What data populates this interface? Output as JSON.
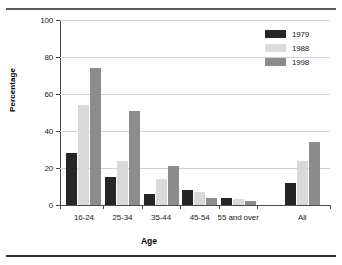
{
  "chart_data": {
    "type": "bar",
    "title": "",
    "xlabel": "Age",
    "ylabel": "Percentage",
    "categories": [
      "16-24",
      "25-34",
      "35-44",
      "45-54",
      "55 and over",
      "All"
    ],
    "series": [
      {
        "name": "1979",
        "color": "#262626",
        "values": [
          28,
          15,
          6,
          8,
          4,
          12
        ]
      },
      {
        "name": "1988",
        "color": "#d9d9d9",
        "values": [
          54,
          24,
          14,
          7,
          3,
          24
        ]
      },
      {
        "name": "1998",
        "color": "#8c8c8c",
        "values": [
          74,
          51,
          21,
          4,
          2,
          34
        ]
      }
    ],
    "ylim": [
      0,
      100
    ],
    "yticks": [
      0,
      20,
      40,
      60,
      80,
      100
    ],
    "ytick_labels": [
      "0",
      "20",
      "40",
      "60",
      "80",
      "100"
    ],
    "grid": true,
    "legend_position": "top-right"
  }
}
